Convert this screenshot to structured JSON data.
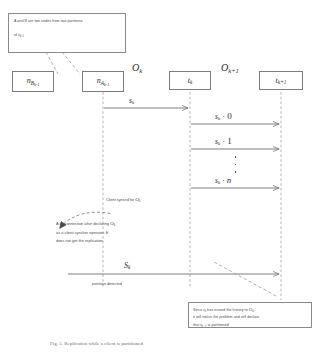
{
  "figure": {
    "caption": "Fig. 5. Replication while a client is partitioned",
    "background": "#ffffff",
    "line_color": "#8a8a8a",
    "text_color": "#2b2b2b"
  },
  "notes": {
    "top": {
      "name": "note-partitions",
      "lines": [
        "A and B are two nodes from two partitions",
        "of  t",
        "k-1"
      ],
      "line1": "A and B are two nodes from two partitions",
      "line2_prefix": "of",
      "line2_symbol": "t",
      "line2_subscript": "k-1"
    },
    "disconnection": {
      "name": "note-disconnection",
      "line1_pre": "A disconnection after declaring",
      "line1_symbol": "O",
      "line1_sub": "k",
      "line2": "as a client syncher operator. E",
      "line3": "does not get the replication"
    },
    "bottom": {
      "name": "note-erased-history",
      "line1_pre": "Since",
      "line1_sym": "t",
      "line1_sub": "k",
      "line1_mid": "has erased the history to",
      "line1_sym2": "O",
      "line1_sub2": "k",
      "line1_end": ",",
      "line2": "it will notice the problem and will declare",
      "line3_pre": "that",
      "line3_sym": "t",
      "line3_sub": "k+1",
      "line3_end": "is partitioned"
    }
  },
  "lifelines": [
    {
      "id": "nB",
      "name": "lifeline-node-b",
      "label_main": "n",
      "label_sub": "B",
      "label_subsub": "k-1",
      "has_line": false
    },
    {
      "id": "nA",
      "name": "lifeline-node-a",
      "label_main": "n",
      "label_sub": "A",
      "label_subsub": "k-1",
      "has_line": true
    },
    {
      "id": "tk",
      "name": "lifeline-tk",
      "label_main": "t",
      "label_sub": "k",
      "has_line": true
    },
    {
      "id": "tk1",
      "name": "lifeline-tk1",
      "label_main": "t",
      "label_sub": "k+1",
      "has_line": true
    }
  ],
  "operators": [
    {
      "name": "operator-ok",
      "symbol": "O",
      "sub": "k"
    },
    {
      "name": "operator-ok1",
      "symbol": "O",
      "sub": "k+1"
    }
  ],
  "messages": [
    {
      "name": "message-sk-to-tk",
      "symbol": "s",
      "sub": "k",
      "suffix": "",
      "from": "nA",
      "to": "tk"
    },
    {
      "name": "message-sk-0",
      "symbol": "s",
      "sub": "k",
      "suffix": "· 0",
      "from": "tk",
      "to": "tk1"
    },
    {
      "name": "message-sk-1",
      "symbol": "s",
      "sub": "k",
      "suffix": "· 1",
      "from": "tk",
      "to": "tk1"
    },
    {
      "name": "message-sk-n",
      "symbol": "s",
      "sub": "k",
      "suffix": "· n",
      "from": "tk",
      "to": "tk1"
    },
    {
      "name": "message-Sk-partition",
      "symbol": "S",
      "sub": "k",
      "suffix": "",
      "from": "nA",
      "to": "tk1"
    }
  ],
  "annotations": {
    "client_synced": {
      "name": "label-client-synced",
      "text": "Client synced for",
      "symbol": "O",
      "sub": "k"
    },
    "partition_detected": {
      "name": "label-partition-detected",
      "text": "partition detected"
    }
  },
  "ellipsis": {
    "name": "vertical-ellipsis",
    "count": 3
  }
}
